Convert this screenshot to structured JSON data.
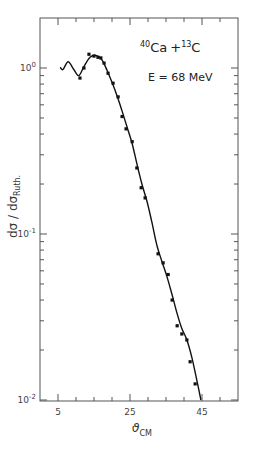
{
  "chart_data": {
    "type": "scatter",
    "title": "",
    "annotations": {
      "reaction": {
        "projectile_mass": "40",
        "projectile": "Ca",
        "plus": "+",
        "target_mass": "13",
        "target": "C"
      },
      "energy": "E = 68 MeV"
    },
    "xlabel": {
      "symbol": "ϑ",
      "subscript": "CM"
    },
    "ylabel": {
      "main": "dσ / dσ",
      "subscript": "Ruth."
    },
    "xlim": [
      0,
      50
    ],
    "ylim": [
      0.01,
      2.0
    ],
    "yscale": "log",
    "x_ticks": [
      {
        "value": 5,
        "label": "5"
      },
      {
        "value": 25,
        "label": "25"
      },
      {
        "value": 45,
        "label": "45"
      }
    ],
    "y_ticks": [
      {
        "value": 1,
        "label_base": "10",
        "label_exp": "0"
      },
      {
        "value": 0.1,
        "label_base": "10",
        "label_exp": "-1"
      },
      {
        "value": 0.01,
        "label_base": "10",
        "label_exp": "-2"
      }
    ],
    "grid": false,
    "legend": null,
    "series": [
      {
        "name": "experimental data",
        "style": "points",
        "x": [
          11.1,
          12.2,
          13.6,
          15.0,
          16.1,
          16.9,
          17.8,
          18.9,
          20.3,
          21.7,
          22.8,
          23.9,
          25.6,
          26.9,
          28.1,
          29.2,
          32.8,
          34.2,
          35.6,
          36.7,
          38.1,
          39.4,
          40.8,
          41.7,
          43.1
        ],
        "y": [
          0.87,
          1.0,
          1.21,
          1.18,
          1.16,
          1.15,
          1.07,
          0.93,
          0.81,
          0.67,
          0.51,
          0.43,
          0.36,
          0.25,
          0.19,
          0.165,
          0.076,
          0.067,
          0.057,
          0.04,
          0.028,
          0.025,
          0.023,
          0.017,
          0.0125
        ]
      },
      {
        "name": "theoretical fit",
        "style": "line",
        "x": [
          5.6,
          6.4,
          7.8,
          9.4,
          10.8,
          12.2,
          13.9,
          15.6,
          17.2,
          18.6,
          20.0,
          21.4,
          22.8,
          24.2,
          25.6,
          27.0,
          28.3,
          29.7,
          31.1,
          32.5,
          33.9,
          35.3,
          36.7,
          38.1,
          39.4,
          40.8,
          42.2,
          43.6,
          44.7
        ],
        "y": [
          1.01,
          0.98,
          1.09,
          0.98,
          0.9,
          1.02,
          1.16,
          1.19,
          1.12,
          0.97,
          0.82,
          0.68,
          0.55,
          0.44,
          0.35,
          0.26,
          0.2,
          0.158,
          0.117,
          0.085,
          0.068,
          0.055,
          0.043,
          0.033,
          0.027,
          0.023,
          0.018,
          0.013,
          0.01
        ]
      }
    ]
  }
}
